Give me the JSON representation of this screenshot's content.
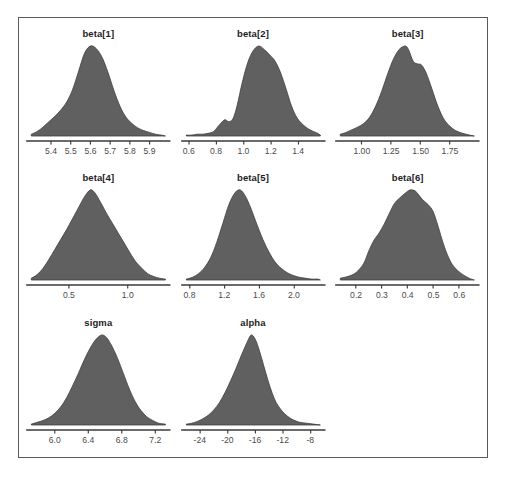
{
  "figure": {
    "top_cut_text": "",
    "frame_color": "#5a5a5a",
    "density_fill": "#606060",
    "density_stroke": "#3f3f3f",
    "axis_color": "#3a3a3a",
    "tick_label_color": "#4a4a4a",
    "title_color": "#1d1d1d"
  },
  "chart_data": {
    "type": "area",
    "title": "",
    "xlabel": "",
    "ylabel": "",
    "grid": false,
    "legend": "none",
    "layout": {
      "rows": 3,
      "cols": 3,
      "panel_order": [
        "beta[1]",
        "beta[2]",
        "beta[3]",
        "beta[4]",
        "beta[5]",
        "beta[6]",
        "sigma",
        "alpha",
        ""
      ]
    },
    "panels": [
      {
        "name": "beta[1]",
        "title": "beta[1]",
        "xlim": [
          5.3,
          5.98
        ],
        "ticks": [
          5.4,
          5.5,
          5.6,
          5.7,
          5.8,
          5.9
        ],
        "tick_labels": [
          "5.4",
          "5.5",
          "5.6",
          "5.7",
          "5.8",
          "5.9"
        ],
        "x": [
          5.3,
          5.33,
          5.36,
          5.39,
          5.42,
          5.45,
          5.48,
          5.51,
          5.54,
          5.57,
          5.6,
          5.63,
          5.66,
          5.69,
          5.72,
          5.75,
          5.78,
          5.81,
          5.84,
          5.87,
          5.9,
          5.93,
          5.96,
          5.98
        ],
        "y": [
          0.02,
          0.05,
          0.1,
          0.16,
          0.22,
          0.29,
          0.38,
          0.52,
          0.72,
          0.92,
          1.0,
          0.97,
          0.87,
          0.7,
          0.5,
          0.33,
          0.21,
          0.14,
          0.09,
          0.06,
          0.04,
          0.02,
          0.01,
          0.0
        ]
      },
      {
        "name": "beta[2]",
        "title": "beta[2]",
        "xlim": [
          0.58,
          1.56
        ],
        "ticks": [
          0.6,
          0.8,
          1.0,
          1.2,
          1.4
        ],
        "tick_labels": [
          "0.6",
          "0.8",
          "1.0",
          "1.2",
          "1.4"
        ],
        "x": [
          0.58,
          0.62,
          0.66,
          0.7,
          0.74,
          0.78,
          0.82,
          0.86,
          0.89,
          0.92,
          0.95,
          0.99,
          1.03,
          1.07,
          1.11,
          1.15,
          1.19,
          1.23,
          1.27,
          1.31,
          1.35,
          1.39,
          1.43,
          1.47,
          1.51,
          1.54,
          1.56
        ],
        "y": [
          0.01,
          0.01,
          0.02,
          0.02,
          0.03,
          0.05,
          0.12,
          0.18,
          0.16,
          0.19,
          0.33,
          0.6,
          0.82,
          0.95,
          1.0,
          0.96,
          0.9,
          0.83,
          0.7,
          0.52,
          0.33,
          0.2,
          0.13,
          0.08,
          0.05,
          0.03,
          0.01
        ]
      },
      {
        "name": "beta[3]",
        "title": "beta[3]",
        "xlim": [
          0.82,
          1.96
        ],
        "ticks": [
          1.0,
          1.25,
          1.5,
          1.75
        ],
        "tick_labels": [
          "1.00",
          "1.25",
          "1.50",
          "1.75"
        ],
        "x": [
          0.82,
          0.87,
          0.92,
          0.97,
          1.02,
          1.07,
          1.12,
          1.17,
          1.22,
          1.27,
          1.32,
          1.37,
          1.4,
          1.44,
          1.48,
          1.51,
          1.55,
          1.6,
          1.65,
          1.7,
          1.75,
          1.8,
          1.86,
          1.92,
          1.96
        ],
        "y": [
          0.02,
          0.04,
          0.07,
          0.1,
          0.14,
          0.21,
          0.33,
          0.49,
          0.68,
          0.85,
          0.96,
          1.0,
          0.96,
          0.83,
          0.8,
          0.79,
          0.7,
          0.52,
          0.33,
          0.19,
          0.11,
          0.06,
          0.03,
          0.01,
          0.0
        ]
      },
      {
        "name": "beta[4]",
        "title": "beta[4]",
        "xlim": [
          0.18,
          1.32
        ],
        "ticks": [
          0.5,
          1.0
        ],
        "tick_labels": [
          "0.5",
          "1.0"
        ],
        "x": [
          0.18,
          0.23,
          0.28,
          0.33,
          0.38,
          0.43,
          0.48,
          0.53,
          0.58,
          0.63,
          0.68,
          0.72,
          0.77,
          0.82,
          0.87,
          0.92,
          0.97,
          1.02,
          1.07,
          1.12,
          1.17,
          1.22,
          1.27,
          1.32
        ],
        "y": [
          0.02,
          0.06,
          0.13,
          0.23,
          0.34,
          0.45,
          0.56,
          0.68,
          0.8,
          0.92,
          1.0,
          0.97,
          0.86,
          0.74,
          0.63,
          0.52,
          0.41,
          0.3,
          0.2,
          0.13,
          0.07,
          0.04,
          0.02,
          0.01
        ]
      },
      {
        "name": "beta[5]",
        "title": "beta[5]",
        "xlim": [
          0.76,
          2.3
        ],
        "ticks": [
          0.8,
          1.2,
          1.6,
          2.0
        ],
        "tick_labels": [
          "0.8",
          "1.2",
          "1.6",
          "2.0"
        ],
        "x": [
          0.76,
          0.83,
          0.9,
          0.97,
          1.04,
          1.11,
          1.18,
          1.25,
          1.32,
          1.38,
          1.44,
          1.5,
          1.57,
          1.64,
          1.71,
          1.78,
          1.85,
          1.92,
          1.99,
          2.06,
          2.13,
          2.2,
          2.27,
          2.3
        ],
        "y": [
          0.01,
          0.03,
          0.07,
          0.14,
          0.25,
          0.42,
          0.63,
          0.84,
          0.97,
          1.0,
          0.93,
          0.8,
          0.62,
          0.45,
          0.31,
          0.2,
          0.13,
          0.08,
          0.05,
          0.03,
          0.02,
          0.01,
          0.01,
          0.0
        ]
      },
      {
        "name": "beta[6]",
        "title": "beta[6]",
        "xlim": [
          0.14,
          0.66
        ],
        "ticks": [
          0.2,
          0.3,
          0.4,
          0.5,
          0.6
        ],
        "tick_labels": [
          "0.2",
          "0.3",
          "0.4",
          "0.5",
          "0.6"
        ],
        "x": [
          0.14,
          0.17,
          0.2,
          0.23,
          0.25,
          0.27,
          0.29,
          0.31,
          0.33,
          0.35,
          0.37,
          0.39,
          0.41,
          0.43,
          0.44,
          0.46,
          0.48,
          0.5,
          0.52,
          0.54,
          0.56,
          0.58,
          0.61,
          0.64,
          0.66
        ],
        "y": [
          0.02,
          0.04,
          0.08,
          0.18,
          0.32,
          0.44,
          0.52,
          0.62,
          0.74,
          0.85,
          0.91,
          0.96,
          1.0,
          0.99,
          0.96,
          0.89,
          0.84,
          0.76,
          0.59,
          0.4,
          0.25,
          0.15,
          0.07,
          0.02,
          0.0
        ]
      },
      {
        "name": "sigma",
        "title": "sigma",
        "xlim": [
          5.72,
          7.32
        ],
        "ticks": [
          6.0,
          6.4,
          6.8,
          7.2
        ],
        "tick_labels": [
          "6.0",
          "6.4",
          "6.8",
          "7.2"
        ],
        "x": [
          5.72,
          5.79,
          5.86,
          5.93,
          6.0,
          6.07,
          6.14,
          6.21,
          6.28,
          6.35,
          6.42,
          6.49,
          6.56,
          6.62,
          6.68,
          6.75,
          6.82,
          6.89,
          6.96,
          7.03,
          7.1,
          7.17,
          7.24,
          7.32
        ],
        "y": [
          0.01,
          0.03,
          0.05,
          0.08,
          0.13,
          0.2,
          0.3,
          0.43,
          0.57,
          0.72,
          0.85,
          0.95,
          1.0,
          0.97,
          0.88,
          0.74,
          0.57,
          0.4,
          0.26,
          0.16,
          0.09,
          0.05,
          0.02,
          0.01
        ]
      },
      {
        "name": "alpha",
        "title": "alpha",
        "xlim": [
          -26.0,
          -6.6
        ],
        "ticks": [
          -24,
          -20,
          -16,
          -12,
          -8
        ],
        "tick_labels": [
          "-24",
          "-20",
          "-16",
          "-12",
          "-8"
        ],
        "x": [
          -26.0,
          -25.2,
          -24.4,
          -23.6,
          -22.8,
          -22.0,
          -21.2,
          -20.4,
          -19.6,
          -18.8,
          -18.0,
          -17.2,
          -16.6,
          -16.0,
          -15.4,
          -14.8,
          -14.2,
          -13.6,
          -13.0,
          -12.2,
          -11.4,
          -10.6,
          -9.6,
          -8.6,
          -7.6,
          -6.6
        ],
        "y": [
          0.01,
          0.02,
          0.04,
          0.07,
          0.11,
          0.17,
          0.25,
          0.36,
          0.49,
          0.63,
          0.78,
          0.92,
          1.0,
          0.95,
          0.82,
          0.66,
          0.5,
          0.36,
          0.25,
          0.16,
          0.1,
          0.06,
          0.03,
          0.02,
          0.01,
          0.0
        ]
      }
    ]
  }
}
